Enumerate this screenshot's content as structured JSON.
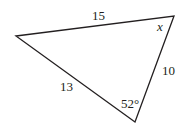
{
  "diagram": {
    "type": "triangle",
    "stroke_color": "#231f20",
    "vertices": {
      "left": [
        16,
        36
      ],
      "top_right": [
        174,
        16
      ],
      "bottom": [
        135,
        122
      ]
    },
    "sides": [
      {
        "between": [
          "left",
          "top_right"
        ],
        "label": "15"
      },
      {
        "between": [
          "left",
          "bottom"
        ],
        "label": "13"
      },
      {
        "between": [
          "top_right",
          "bottom"
        ],
        "label": "10"
      }
    ],
    "angles": [
      {
        "vertex": "top_right",
        "label": "x"
      },
      {
        "vertex": "bottom",
        "label": "52°"
      }
    ]
  },
  "labels": {
    "side_top": "15",
    "side_left": "13",
    "side_right": "10",
    "angle_top_right": "x",
    "angle_bottom": "52°"
  }
}
